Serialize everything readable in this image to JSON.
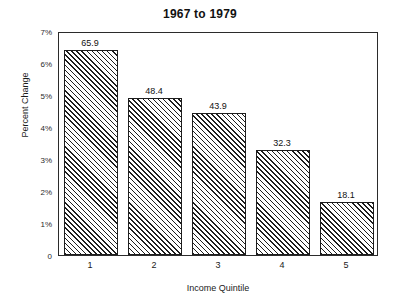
{
  "chart_data": {
    "type": "bar",
    "title": "1967 to 1979",
    "xlabel": "Income Quintile",
    "ylabel": "Percent Change",
    "categories": [
      "1",
      "2",
      "3",
      "4",
      "5"
    ],
    "values": [
      6.4,
      4.9,
      4.45,
      3.28,
      1.66
    ],
    "point_labels": [
      "65.9",
      "48.4",
      "43.9",
      "32.3",
      "18.1"
    ],
    "ylim": [
      0,
      7
    ],
    "ytick_values": [
      0,
      1,
      2,
      3,
      4,
      5,
      6,
      7
    ],
    "ytick_labels": [
      "0",
      "1%",
      "2%",
      "3%",
      "4%",
      "5%",
      "6%",
      "7%"
    ],
    "grid": false,
    "legend": "none",
    "bar_fill": "diagonal-hatch",
    "colors": {
      "bar_line": "#1d1d1d",
      "bar_face": "#ffffff",
      "frame": "#2b2b2b",
      "text": "#111111"
    }
  }
}
